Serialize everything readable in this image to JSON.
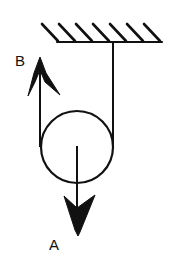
{
  "diagram": {
    "type": "pulley-system",
    "labels": {
      "B": "B",
      "A": "A"
    },
    "elements": {
      "ceiling": {
        "kind": "fixed-support",
        "hatch_count": 7
      },
      "pulley": {
        "kind": "circle"
      },
      "rope_fixed_segment": {
        "attached_to": "ceiling"
      },
      "rope_free_segment": {
        "direction": "up",
        "label": "B"
      },
      "force_arrow": {
        "direction": "down",
        "label": "A",
        "origin": "pulley-center"
      }
    },
    "colors": {
      "stroke": "#111111",
      "background": "#ffffff"
    }
  }
}
